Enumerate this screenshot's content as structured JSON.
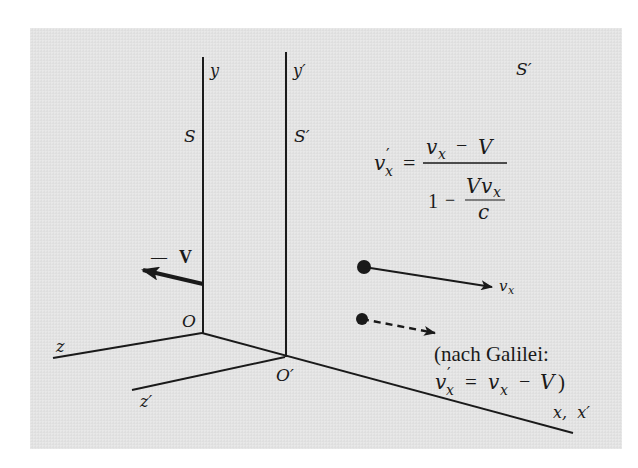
{
  "figure": {
    "background_color": "#e3e3e3",
    "ink_color": "#1a1a1a",
    "frames": {
      "S": {
        "label": "S",
        "origin_label": "O",
        "y_axis_label": "y",
        "z_axis_label": "z"
      },
      "S_prime": {
        "label": "S′",
        "origin_label": "O′",
        "y_axis_label": "y′",
        "z_axis_label": "z′"
      }
    },
    "x_axis_label": "x,  x′",
    "corner_label": "S′",
    "velocity_frame": {
      "sign": "—",
      "symbol": "V"
    },
    "particle_velocity_label": {
      "base": "v",
      "sub": "x"
    },
    "relativistic_formula": {
      "lhs_base": "v",
      "lhs_prime": "′",
      "lhs_sub": "x",
      "equals": "=",
      "numerator": {
        "v": "v",
        "sub": "x",
        "minus": "−",
        "V": "V"
      },
      "denominator": {
        "one": "1",
        "minus": "−",
        "num_V": "V",
        "num_v": "v",
        "num_sub": "x",
        "den": "c"
      }
    },
    "galilei_note": {
      "line1": "(nach Galilei:",
      "lhs_base": "v",
      "lhs_prime": "′",
      "lhs_sub": "x",
      "equals": "=",
      "rhs_base": "v",
      "rhs_sub": "x",
      "minus": "−",
      "V": "V",
      "close": ")"
    }
  }
}
